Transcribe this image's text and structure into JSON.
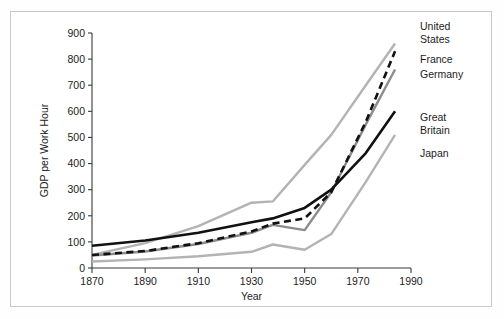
{
  "chart_data": {
    "type": "line",
    "title": "",
    "xlabel": "Year",
    "ylabel": "GDP per Work Hour",
    "xlim": [
      1870,
      1990
    ],
    "ylim": [
      0,
      900
    ],
    "xticks": [
      1870,
      1890,
      1910,
      1930,
      1950,
      1970,
      1990
    ],
    "yticks": [
      0,
      100,
      200,
      300,
      400,
      500,
      600,
      700,
      800,
      900
    ],
    "grid": false,
    "legend_position": "right-inline-labels",
    "series": [
      {
        "name": "United States",
        "color": "#b3b3b3",
        "style": "solid",
        "label_lines": [
          "United",
          "States"
        ],
        "x": [
          1870,
          1890,
          1910,
          1930,
          1938,
          1950,
          1960,
          1973,
          1984
        ],
        "y": [
          50,
          95,
          160,
          250,
          255,
          395,
          510,
          700,
          860
        ]
      },
      {
        "name": "France",
        "color": "#111111",
        "style": "dashed",
        "label_lines": [
          "France"
        ],
        "x": [
          1870,
          1890,
          1910,
          1930,
          1938,
          1950,
          1960,
          1973,
          1984
        ],
        "y": [
          50,
          65,
          95,
          140,
          170,
          190,
          290,
          560,
          830
        ]
      },
      {
        "name": "Germany",
        "color": "#8c8c8c",
        "style": "solid",
        "label_lines": [
          "Germany"
        ],
        "x": [
          1870,
          1890,
          1910,
          1930,
          1938,
          1950,
          1960,
          1973,
          1984
        ],
        "y": [
          48,
          63,
          92,
          135,
          165,
          145,
          290,
          550,
          760
        ]
      },
      {
        "name": "Great Britain",
        "color": "#111111",
        "style": "solid",
        "label_lines": [
          "Great",
          "Britain"
        ],
        "x": [
          1870,
          1890,
          1910,
          1930,
          1938,
          1950,
          1960,
          1973,
          1984
        ],
        "y": [
          85,
          105,
          135,
          175,
          190,
          230,
          300,
          440,
          600
        ]
      },
      {
        "name": "Japan",
        "color": "#b3b3b3",
        "style": "solid",
        "label_lines": [
          "Japan"
        ],
        "x": [
          1870,
          1890,
          1910,
          1930,
          1938,
          1950,
          1960,
          1973,
          1984
        ],
        "y": [
          25,
          33,
          45,
          62,
          90,
          70,
          130,
          330,
          510
        ]
      }
    ],
    "series_labels": [
      {
        "name": "United States",
        "lines": [
          "United",
          "States"
        ],
        "x": 420,
        "y": 30
      },
      {
        "name": "France",
        "lines": [
          "France"
        ],
        "x": 420,
        "y": 63
      },
      {
        "name": "Germany",
        "lines": [
          "Germany"
        ],
        "x": 420,
        "y": 78
      },
      {
        "name": "Great Britain",
        "lines": [
          "Great",
          "Britain"
        ],
        "x": 420,
        "y": 121
      },
      {
        "name": "Japan",
        "lines": [
          "Japan"
        ],
        "x": 420,
        "y": 157
      }
    ]
  }
}
